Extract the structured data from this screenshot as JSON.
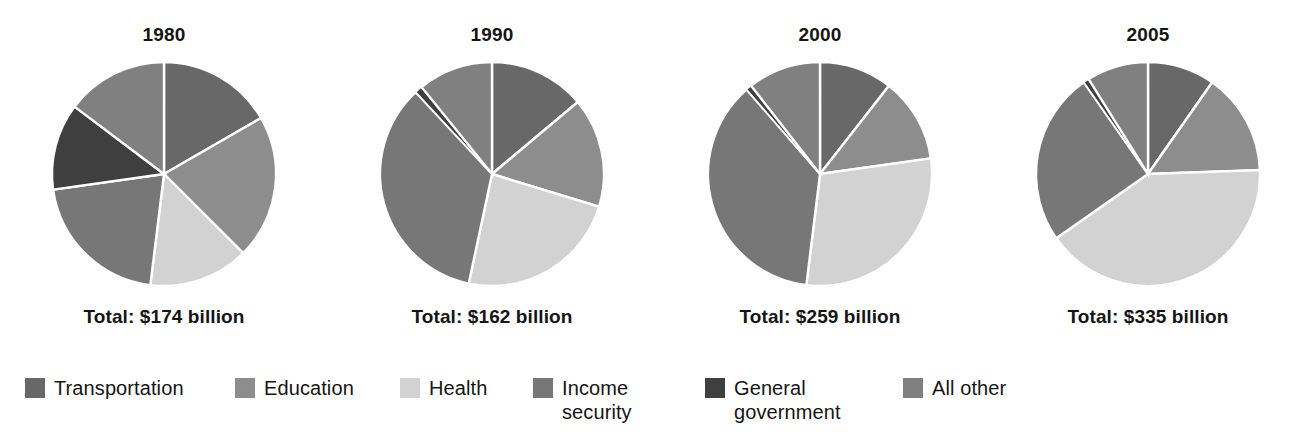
{
  "chart_data": {
    "type": "pie",
    "title": "",
    "subtitle": "",
    "xlabel": "",
    "ylabel": "",
    "grid": false,
    "legend_position": "bottom",
    "unit": "billion dollars",
    "categories": [
      "Transportation",
      "Education",
      "Health",
      "Income security",
      "General government",
      "All other"
    ],
    "category_colors": [
      "#686868",
      "#8d8d8d",
      "#d2d2d2",
      "#777777",
      "#3f3f3f",
      "#808080"
    ],
    "charts": [
      {
        "year": "1980",
        "total_label": "Total: $174 billion",
        "total_value": 174,
        "slices": [
          {
            "label": "Transportation",
            "degrees": 60,
            "percent": 16.7
          },
          {
            "label": "Education",
            "degrees": 75,
            "percent": 20.8
          },
          {
            "label": "Health",
            "degrees": 52,
            "percent": 14.4
          },
          {
            "label": "Income security",
            "degrees": 75,
            "percent": 20.8
          },
          {
            "label": "General government",
            "degrees": 45,
            "percent": 12.5
          },
          {
            "label": "All other",
            "degrees": 53,
            "percent": 14.8
          }
        ]
      },
      {
        "year": "1990",
        "total_label": "Total: $162 billion",
        "total_value": 162,
        "slices": [
          {
            "label": "Transportation",
            "degrees": 50,
            "percent": 13.9
          },
          {
            "label": "Education",
            "degrees": 57,
            "percent": 15.8
          },
          {
            "label": "Health",
            "degrees": 85,
            "percent": 23.6
          },
          {
            "label": "Income security",
            "degrees": 125,
            "percent": 34.7
          },
          {
            "label": "General government",
            "degrees": 4,
            "percent": 1.1
          },
          {
            "label": "All other",
            "degrees": 39,
            "percent": 10.9
          }
        ]
      },
      {
        "year": "2000",
        "total_label": "Total: $259 billion",
        "total_value": 259,
        "slices": [
          {
            "label": "Transportation",
            "degrees": 38,
            "percent": 10.6
          },
          {
            "label": "Education",
            "degrees": 44,
            "percent": 12.2
          },
          {
            "label": "Health",
            "degrees": 105,
            "percent": 29.2
          },
          {
            "label": "Income security",
            "degrees": 132,
            "percent": 36.7
          },
          {
            "label": "General government",
            "degrees": 3,
            "percent": 0.8
          },
          {
            "label": "All other",
            "degrees": 38,
            "percent": 10.5
          }
        ]
      },
      {
        "year": "2005",
        "total_label": "Total: $335 billion",
        "total_value": 335,
        "slices": [
          {
            "label": "Transportation",
            "degrees": 35,
            "percent": 9.7
          },
          {
            "label": "Education",
            "degrees": 53,
            "percent": 14.7
          },
          {
            "label": "Health",
            "degrees": 147,
            "percent": 40.8
          },
          {
            "label": "Income security",
            "degrees": 90,
            "percent": 25.0
          },
          {
            "label": "General government",
            "degrees": 3,
            "percent": 0.8
          },
          {
            "label": "All other",
            "degrees": 32,
            "percent": 9.0
          }
        ]
      }
    ]
  },
  "panels": [
    {
      "title": "1980",
      "total": "Total: $174 billion"
    },
    {
      "title": "1990",
      "total": "Total: $162 billion"
    },
    {
      "title": "2000",
      "total": "Total: $259 billion"
    },
    {
      "title": "2005",
      "total": "Total: $335 billion"
    }
  ],
  "legend": {
    "items": [
      {
        "label": "Transportation",
        "color": "#686868",
        "x": 25,
        "y": 6
      },
      {
        "label": "Education",
        "color": "#8d8d8d",
        "x": 235,
        "y": 6
      },
      {
        "label": "Health",
        "color": "#d2d2d2",
        "x": 400,
        "y": 6
      },
      {
        "label": "Income\nsecurity",
        "color": "#777777",
        "x": 533,
        "y": 6
      },
      {
        "label": "General\ngovernment",
        "color": "#3f3f3f",
        "x": 705,
        "y": 6
      },
      {
        "label": "All other",
        "color": "#808080",
        "x": 903,
        "y": 6
      }
    ]
  },
  "style": {
    "background": "#ffffff",
    "text_color": "#151515",
    "slice_separator": "#ffffff"
  }
}
